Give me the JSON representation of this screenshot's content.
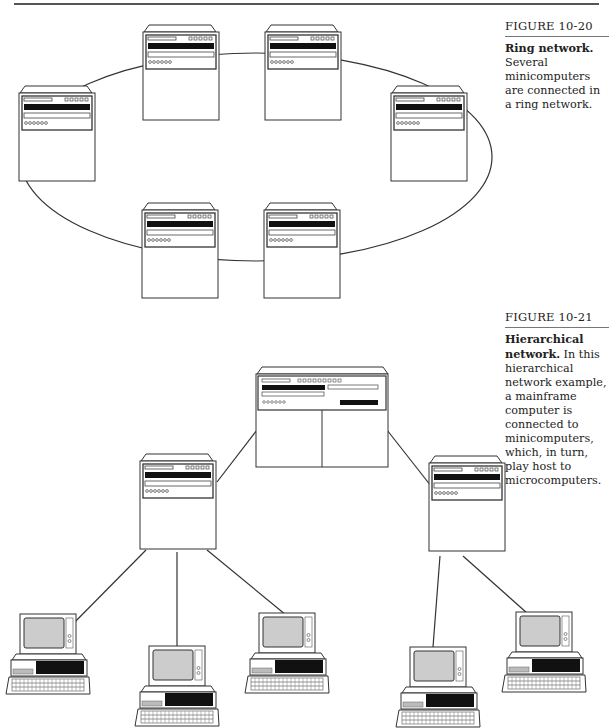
{
  "page": {
    "figures": [
      {
        "label": "FIGURE 10-20",
        "caption_lead": "Ring network.",
        "caption_body": " Several minicomputers are connected in a ring network.",
        "topology": "ring",
        "nodes": [
          "minicomputer",
          "minicomputer",
          "minicomputer",
          "minicomputer",
          "minicomputer",
          "minicomputer"
        ]
      },
      {
        "label": "FIGURE 10-21",
        "caption_lead": "Hierarchical network.",
        "caption_body": " In this hierarchical network example, a mainframe computer is connected to minicomputers, which, in turn, play host to microcomputers.",
        "topology": "hierarchical",
        "nodes": {
          "root": "mainframe",
          "level1": [
            "minicomputer",
            "minicomputer"
          ],
          "level2": [
            [
              "microcomputer",
              "microcomputer",
              "microcomputer"
            ],
            [
              "microcomputer",
              "microcomputer"
            ]
          ]
        }
      }
    ]
  }
}
